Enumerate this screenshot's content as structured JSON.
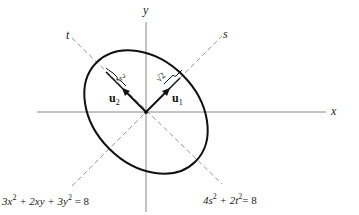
{
  "diagram": {
    "axes": {
      "x_label": "x",
      "y_label": "y",
      "s_label": "s",
      "t_label": "t"
    },
    "vectors": {
      "u1": {
        "label": "u",
        "subscript": "1"
      },
      "u2": {
        "label": "u",
        "subscript": "2"
      }
    },
    "lengths": {
      "along_s": "√2",
      "along_t": "2"
    },
    "equations": {
      "xy_form": {
        "a": "3x",
        "a_exp": "2",
        "b": " + 2xy + 3y",
        "b_exp": "2",
        "c": " = 8"
      },
      "st_form": {
        "a": "4s",
        "a_exp": "2",
        "b": " + 2t",
        "b_exp": "2",
        "c": "= 8"
      }
    },
    "colors": {
      "ellipse": "#111111",
      "axes": "#777777",
      "dashed_axes": "#888888",
      "vectors": "#111111"
    }
  }
}
